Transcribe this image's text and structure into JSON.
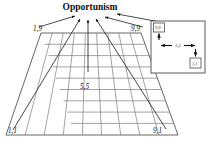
{
  "figure": {
    "title": "Opportunism",
    "type": "managerial-grid-perspective-diagram",
    "background_color": "#ffffff",
    "grid_line_color": "#7d7d7d",
    "arrow_color": "#1a1a1a",
    "grid": {
      "columns": 9,
      "rows": 9,
      "shape": "trapezoid-perspective"
    },
    "corner_labels": {
      "top_left": "1,9",
      "top_right": "9,9",
      "bottom_left": "1,1",
      "bottom_right": "9,1"
    },
    "center_label": "5,5",
    "arrow_targets": [
      "1,9",
      "9,9",
      "5,5",
      "1,1",
      "9,1"
    ],
    "inset": {
      "corner_label": "9,9",
      "center_label": "5,5",
      "lower_label": "1,1"
    }
  }
}
